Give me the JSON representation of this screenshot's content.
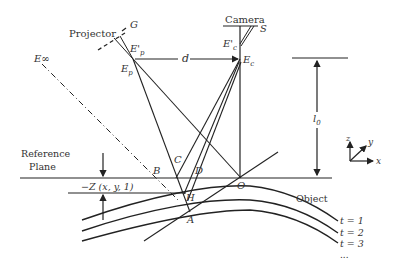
{
  "labels": {
    "projector": "Projector",
    "camera": "Camera",
    "G": "G",
    "S": "S",
    "Ep_prime": "E'",
    "Ep_prime_sub": "p",
    "Ep": "E",
    "Ep_sub": "p",
    "Ec_prime": "E'",
    "Ec_prime_sub": "c",
    "Ec": "E",
    "Ec_sub": "c",
    "Einf": "E∞",
    "d": "d",
    "l0": "l",
    "l0_sub": "0",
    "reference_plane_line1": "Reference",
    "reference_plane_line2": "Plane",
    "B": "B",
    "C": "C",
    "D": "D",
    "H": "H",
    "A": "A",
    "O": "O",
    "z_expr": "−Z (x, y, 1)",
    "object": "Object",
    "t1": "t = 1",
    "t2": "t = 2",
    "t3": "t = 3",
    "ellipsis": "...",
    "axis_x": "x",
    "axis_y": "y",
    "axis_z": "z"
  },
  "colors": {
    "line": "#222222",
    "text": "#333333",
    "background": "#ffffff"
  }
}
